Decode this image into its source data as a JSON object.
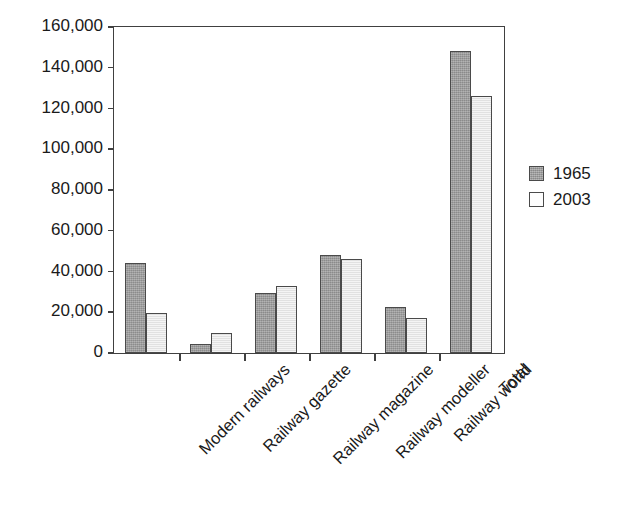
{
  "chart_data": {
    "type": "bar",
    "title": "",
    "subtitle": "",
    "xlabel": "",
    "ylabel": "",
    "ylim": [
      0,
      160000
    ],
    "ytick_step": 20000,
    "ytick_labels": [
      "0",
      "20,000",
      "40,000",
      "60,000",
      "80,000",
      "100,000",
      "120,000",
      "140,000",
      "160,000"
    ],
    "ytick_values": [
      0,
      20000,
      40000,
      60000,
      80000,
      100000,
      120000,
      140000,
      160000
    ],
    "grid": false,
    "legend_position": "right",
    "categories": [
      "Modern railways",
      "Railway gazette",
      "Railway magazine",
      "Railway modeller",
      "Railway world",
      "Total"
    ],
    "series": [
      {
        "name": "1965",
        "color": "#9c9c9c",
        "values": [
          44000,
          4500,
          29500,
          48000,
          22500,
          148000
        ]
      },
      {
        "name": "2003",
        "color": "#e9e9e9",
        "values": [
          19500,
          10000,
          33000,
          46000,
          17000,
          126000
        ]
      }
    ],
    "annotations": []
  }
}
